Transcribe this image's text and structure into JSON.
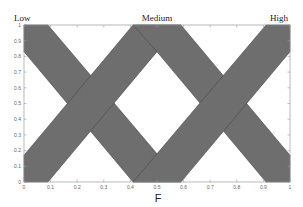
{
  "chart_data": {
    "type": "area",
    "title": "",
    "xlabel": "F",
    "ylabel": "",
    "xlim": [
      0,
      1
    ],
    "ylim": [
      0,
      1
    ],
    "grid": false,
    "legend": "none",
    "x_ticks": [
      "0",
      "0.1",
      "0.2",
      "0.3",
      "0.4",
      "0.5",
      "0.6",
      "0.7",
      "0.8",
      "0.9",
      "1"
    ],
    "y_ticks": [
      "0",
      "0.1",
      "0.2",
      "0.3",
      "0.4",
      "0.5",
      "0.6",
      "0.7",
      "0.8",
      "0.9",
      "1"
    ],
    "annotations": [
      {
        "text": "Low",
        "x": 0.0
      },
      {
        "text": "Medium",
        "x": 0.5
      },
      {
        "text": "High",
        "x": 1.0
      }
    ],
    "series": [
      {
        "name": "Low",
        "description": "Interval type-2 fuzzy set footprint of uncertainty (decreasing)",
        "upper_mf": [
          [
            0,
            1
          ],
          [
            0.09,
            1
          ],
          [
            0.59,
            0
          ]
        ],
        "lower_mf": [
          [
            0,
            0.83
          ],
          [
            0.41,
            0
          ]
        ]
      },
      {
        "name": "Medium",
        "description": "Interval type-2 fuzzy set footprint of uncertainty (triangular)",
        "upper_mf": [
          [
            0.09,
            0
          ],
          [
            0.41,
            1
          ],
          [
            0.59,
            1
          ],
          [
            0.91,
            0
          ]
        ],
        "lower_mf": [
          [
            0.41,
            0
          ],
          [
            0.5,
            0.17
          ],
          [
            0.59,
            0
          ]
        ],
        "lower_mf_outer": [
          [
            0,
            0.17
          ],
          [
            0.41,
            0.83
          ]
        ],
        "note": "lower membership triangle apex approx (0.5, 0.83)"
      },
      {
        "name": "High",
        "description": "Interval type-2 fuzzy set footprint of uncertainty (increasing)",
        "upper_mf": [
          [
            0.41,
            0
          ],
          [
            0.91,
            1
          ],
          [
            1,
            1
          ]
        ],
        "lower_mf": [
          [
            0.59,
            0
          ],
          [
            1,
            0.83
          ]
        ]
      }
    ],
    "fill_color": "#6e6e6e",
    "edge_color": "#4a4a4a"
  },
  "labels": {
    "low": "Low",
    "medium": "Medium",
    "high": "High",
    "xlabel": "F"
  }
}
